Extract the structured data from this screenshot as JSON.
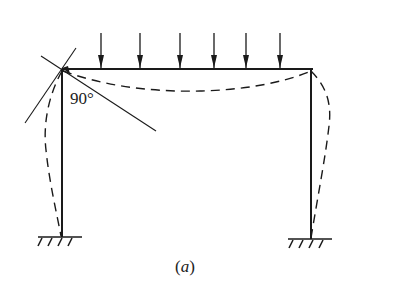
{
  "figure": {
    "caption_open": "(",
    "caption_letter": "a",
    "caption_close": ")",
    "angle_label": "90°",
    "load_arrow_count": 6,
    "colors": {
      "line": "#1a1a1a",
      "background": "#ffffff"
    }
  }
}
